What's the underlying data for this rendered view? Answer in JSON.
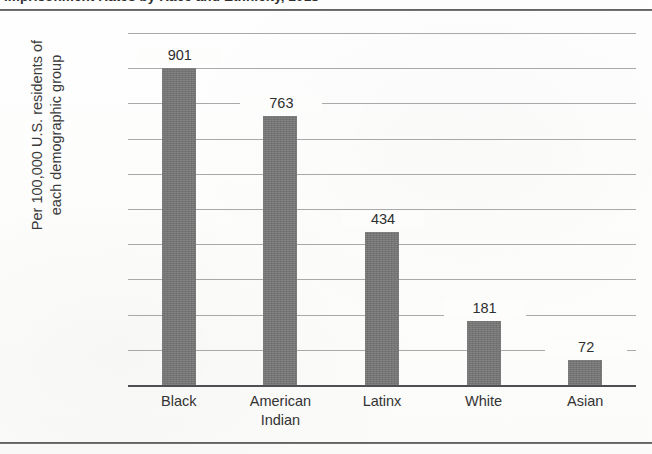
{
  "figure": {
    "clipped_caption_fragment": "Imprisonment Rates by Race and Ethnicity, 2018",
    "frame_rules": 2
  },
  "chart_data": {
    "type": "bar",
    "title": "",
    "xlabel": "",
    "ylabel": "Per 100,000 U.S. residents of each demographic group",
    "ylabel_line1": "Per 100,000 U.S. residents of",
    "ylabel_line2": "each demographic group",
    "categories": [
      "Black",
      "American Indian",
      "Latinx",
      "White",
      "Asian"
    ],
    "category_lines": [
      [
        "Black"
      ],
      [
        "American",
        "Indian"
      ],
      [
        "Latinx"
      ],
      [
        "White"
      ],
      [
        "Asian"
      ]
    ],
    "values": [
      901,
      763,
      434,
      181,
      72
    ],
    "value_labels": [
      "901",
      "763",
      "434",
      "181",
      "72"
    ],
    "ylim": [
      0,
      1000
    ],
    "ytick_values": [
      1000,
      900,
      800,
      700,
      600,
      500,
      400,
      300,
      200,
      100,
      0
    ],
    "ytick_labels": [
      "1,000",
      "900",
      "800",
      "700",
      "600",
      "500",
      "400",
      "300",
      "200",
      "100",
      "0"
    ],
    "grid": true,
    "grid_axis": "y",
    "legend": "none",
    "bar_color": "#767676",
    "gridline_color": "#9a9a9a",
    "axis_color": "#4e4f52"
  }
}
